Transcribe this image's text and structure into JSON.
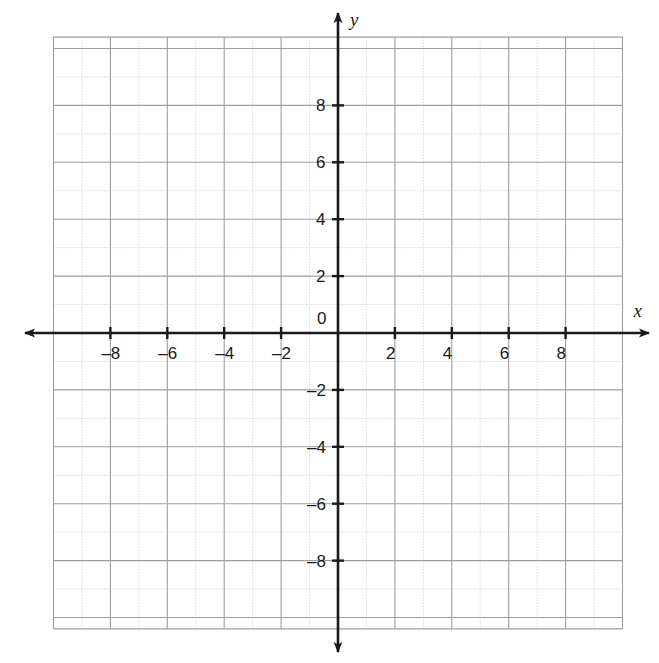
{
  "figure": {
    "type": "coordinate-plane",
    "background_color": "#ffffff",
    "axis_color": "#1a1a1a",
    "grid_major_color": "#9e9e9e",
    "grid_minor_color": "#d8d8d8",
    "label_color": "#1a1a1a"
  },
  "axes": {
    "x_axis_label": "x",
    "y_axis_label": "y",
    "origin_label": "0",
    "x_min": -10,
    "x_max": 10,
    "y_min": -10.4,
    "y_max": 10.4,
    "tick_step": 2,
    "grid_step": 1,
    "arrowheads": [
      "left",
      "right",
      "up",
      "down"
    ]
  },
  "x_ticks": [
    {
      "value": -8,
      "label": "–8"
    },
    {
      "value": -6,
      "label": "–6"
    },
    {
      "value": -4,
      "label": "–4"
    },
    {
      "value": -2,
      "label": "–2"
    },
    {
      "value": 2,
      "label": "2"
    },
    {
      "value": 4,
      "label": "4"
    },
    {
      "value": 6,
      "label": "6"
    },
    {
      "value": 8,
      "label": "8"
    }
  ],
  "y_ticks": [
    {
      "value": 8,
      "label": "8"
    },
    {
      "value": 6,
      "label": "6"
    },
    {
      "value": 4,
      "label": "4"
    },
    {
      "value": 2,
      "label": "2"
    },
    {
      "value": -2,
      "label": "–2"
    },
    {
      "value": -4,
      "label": "–4"
    },
    {
      "value": -6,
      "label": "–6"
    },
    {
      "value": -8,
      "label": "–8"
    }
  ],
  "chart_data": {
    "type": "scatter",
    "title": "",
    "subtitle": "",
    "xlabel": "x",
    "ylabel": "y",
    "xlim": [
      -10,
      10
    ],
    "ylim": [
      -10.4,
      10.4
    ],
    "grid": true,
    "grid_step": 1,
    "tick_step": 2,
    "legend": null,
    "legend_position": "none",
    "xticks": [
      -8,
      -6,
      -4,
      -2,
      0,
      2,
      4,
      6,
      8
    ],
    "xticklabels": [
      "–8",
      "–6",
      "–4",
      "–2",
      "0",
      "2",
      "4",
      "6",
      "8"
    ],
    "yticks": [
      -8,
      -6,
      -4,
      -2,
      2,
      4,
      6,
      8
    ],
    "yticklabels": [
      "–8",
      "–6",
      "–4",
      "–2",
      "2",
      "4",
      "6",
      "8"
    ],
    "series": [],
    "annotations": [],
    "note": "Empty Cartesian grid with no plotted data points, curves, or shaded regions."
  }
}
